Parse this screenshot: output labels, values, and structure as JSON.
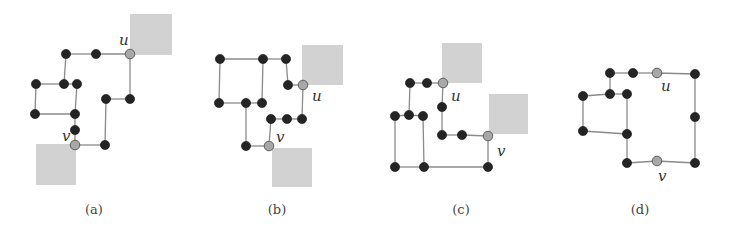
{
  "figures": [
    {
      "id": "a",
      "caption": "(a)",
      "caption_pos": [
        94,
        214
      ],
      "blocks": [
        [
          130,
          14,
          42,
          41
        ],
        [
          36,
          144,
          40,
          41
        ]
      ],
      "nodes": [
        {
          "x": 66,
          "y": 54,
          "type": "dark"
        },
        {
          "x": 96,
          "y": 54,
          "type": "dark"
        },
        {
          "x": 130,
          "y": 54,
          "type": "gray",
          "label": "u",
          "lx": 119,
          "ly": 45
        },
        {
          "x": 36,
          "y": 84,
          "type": "dark"
        },
        {
          "x": 64,
          "y": 84,
          "type": "dark"
        },
        {
          "x": 77,
          "y": 84,
          "type": "dark"
        },
        {
          "x": 35,
          "y": 114,
          "type": "dark"
        },
        {
          "x": 75,
          "y": 114,
          "type": "dark"
        },
        {
          "x": 106,
          "y": 99,
          "type": "dark"
        },
        {
          "x": 130,
          "y": 99,
          "type": "dark"
        },
        {
          "x": 75,
          "y": 130,
          "type": "dark"
        },
        {
          "x": 75,
          "y": 145,
          "type": "gray",
          "label": "v",
          "lx": 62,
          "ly": 141
        },
        {
          "x": 105,
          "y": 145,
          "type": "dark"
        }
      ],
      "edges": [
        [
          0,
          1
        ],
        [
          1,
          2
        ],
        [
          0,
          4
        ],
        [
          3,
          4
        ],
        [
          4,
          5
        ],
        [
          3,
          6
        ],
        [
          6,
          7
        ],
        [
          5,
          7
        ],
        [
          7,
          10
        ],
        [
          10,
          11
        ],
        [
          11,
          12
        ],
        [
          12,
          8
        ],
        [
          8,
          9
        ],
        [
          9,
          2
        ]
      ]
    },
    {
      "id": "b",
      "caption": "(b)",
      "caption_pos": [
        277,
        214
      ],
      "blocks": [
        [
          302,
          45,
          41,
          40
        ],
        [
          272,
          148,
          40,
          39
        ]
      ],
      "nodes": [
        {
          "x": 220,
          "y": 59,
          "type": "dark"
        },
        {
          "x": 263,
          "y": 59,
          "type": "dark"
        },
        {
          "x": 286,
          "y": 59,
          "type": "dark"
        },
        {
          "x": 288,
          "y": 85,
          "type": "dark"
        },
        {
          "x": 303,
          "y": 85,
          "type": "gray",
          "label": "u",
          "lx": 312,
          "ly": 101
        },
        {
          "x": 219,
          "y": 103,
          "type": "dark"
        },
        {
          "x": 246,
          "y": 103,
          "type": "dark"
        },
        {
          "x": 262,
          "y": 103,
          "type": "dark"
        },
        {
          "x": 271,
          "y": 119,
          "type": "dark"
        },
        {
          "x": 287,
          "y": 119,
          "type": "dark"
        },
        {
          "x": 302,
          "y": 119,
          "type": "dark"
        },
        {
          "x": 246,
          "y": 146,
          "type": "dark"
        },
        {
          "x": 269,
          "y": 146,
          "type": "gray",
          "label": "v",
          "lx": 276,
          "ly": 142
        }
      ],
      "edges": [
        [
          0,
          1
        ],
        [
          1,
          2
        ],
        [
          0,
          5
        ],
        [
          5,
          6
        ],
        [
          6,
          7
        ],
        [
          1,
          7
        ],
        [
          2,
          3
        ],
        [
          3,
          4
        ],
        [
          4,
          10
        ],
        [
          10,
          9
        ],
        [
          9,
          8
        ],
        [
          8,
          12
        ],
        [
          12,
          11
        ],
        [
          11,
          6
        ]
      ]
    },
    {
      "id": "c",
      "caption": "(c)",
      "caption_pos": [
        461,
        214
      ],
      "blocks": [
        [
          442,
          43,
          40,
          40
        ],
        [
          489,
          94,
          39,
          40
        ]
      ],
      "nodes": [
        {
          "x": 410,
          "y": 83,
          "type": "dark"
        },
        {
          "x": 427,
          "y": 83,
          "type": "dark"
        },
        {
          "x": 443,
          "y": 83,
          "type": "gray",
          "label": "u",
          "lx": 451,
          "ly": 101
        },
        {
          "x": 442,
          "y": 107,
          "type": "dark"
        },
        {
          "x": 395,
          "y": 116,
          "type": "dark"
        },
        {
          "x": 409,
          "y": 115,
          "type": "dark"
        },
        {
          "x": 423,
          "y": 116,
          "type": "dark"
        },
        {
          "x": 442,
          "y": 135,
          "type": "dark"
        },
        {
          "x": 462,
          "y": 135,
          "type": "dark"
        },
        {
          "x": 488,
          "y": 136,
          "type": "gray",
          "label": "v",
          "lx": 497,
          "ly": 156
        },
        {
          "x": 395,
          "y": 167,
          "type": "dark"
        },
        {
          "x": 424,
          "y": 167,
          "type": "dark"
        },
        {
          "x": 488,
          "y": 167,
          "type": "dark"
        }
      ],
      "edges": [
        [
          0,
          1
        ],
        [
          1,
          2
        ],
        [
          0,
          5
        ],
        [
          4,
          5
        ],
        [
          5,
          6
        ],
        [
          2,
          3
        ],
        [
          3,
          7
        ],
        [
          7,
          8
        ],
        [
          8,
          9
        ],
        [
          9,
          12
        ],
        [
          12,
          11
        ],
        [
          11,
          10
        ],
        [
          4,
          10
        ],
        [
          6,
          11
        ]
      ]
    },
    {
      "id": "d",
      "caption": "(d)",
      "caption_pos": [
        640,
        214
      ],
      "blocks": [],
      "nodes": [
        {
          "x": 610,
          "y": 73,
          "type": "dark"
        },
        {
          "x": 633,
          "y": 73,
          "type": "dark"
        },
        {
          "x": 657,
          "y": 73,
          "type": "gray",
          "label": "u",
          "lx": 661,
          "ly": 91
        },
        {
          "x": 695,
          "y": 74,
          "type": "dark"
        },
        {
          "x": 583,
          "y": 96,
          "type": "dark"
        },
        {
          "x": 610,
          "y": 94,
          "type": "dark"
        },
        {
          "x": 627,
          "y": 94,
          "type": "dark"
        },
        {
          "x": 695,
          "y": 117,
          "type": "dark"
        },
        {
          "x": 583,
          "y": 131,
          "type": "dark"
        },
        {
          "x": 627,
          "y": 134,
          "type": "dark"
        },
        {
          "x": 627,
          "y": 163,
          "type": "dark"
        },
        {
          "x": 657,
          "y": 161,
          "type": "gray",
          "label": "v",
          "lx": 658,
          "ly": 181
        },
        {
          "x": 695,
          "y": 163,
          "type": "dark"
        }
      ],
      "edges": [
        [
          0,
          1
        ],
        [
          1,
          2
        ],
        [
          2,
          3
        ],
        [
          0,
          5
        ],
        [
          4,
          5
        ],
        [
          5,
          6
        ],
        [
          4,
          8
        ],
        [
          8,
          9
        ],
        [
          6,
          9
        ],
        [
          9,
          10
        ],
        [
          10,
          11
        ],
        [
          11,
          12
        ],
        [
          3,
          7
        ],
        [
          7,
          12
        ]
      ]
    }
  ],
  "colors": {
    "node_dark": "#242424",
    "node_gray": "#a8a8a8",
    "edge": "#8a8a8a",
    "block": "#d2d2d2"
  }
}
